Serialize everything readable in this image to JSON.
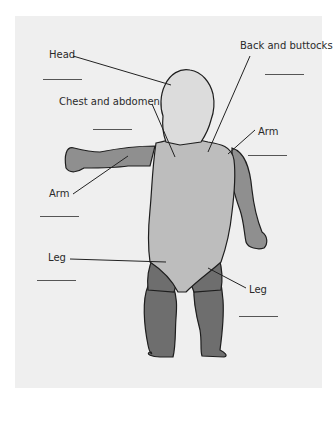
{
  "diagram": {
    "type": "body-region-labeling",
    "colors": {
      "background": "#efefef",
      "head": "#dcdcdc",
      "trunk": "#bdbdbd",
      "arm": "#8f8f8f",
      "leg": "#6e6e6e",
      "outline": "#1e1e1e",
      "leader": "#222222"
    },
    "labels": [
      {
        "id": "head",
        "text": "Head"
      },
      {
        "id": "back",
        "text": "Back and buttocks"
      },
      {
        "id": "chest",
        "text": "Chest and abdomen"
      },
      {
        "id": "arm_right",
        "text": "Arm"
      },
      {
        "id": "arm_left",
        "text": "Arm"
      },
      {
        "id": "leg_left",
        "text": "Leg"
      },
      {
        "id": "leg_right",
        "text": "Leg"
      }
    ],
    "answer_blanks": 7
  }
}
